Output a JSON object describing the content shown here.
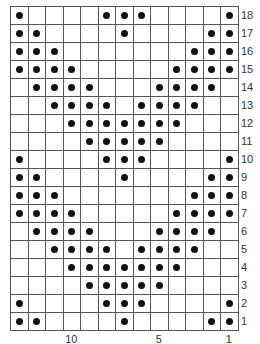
{
  "chart_data": {
    "type": "knitting-chart",
    "columns": 13,
    "rows": 18,
    "column_numbering": "right-to-left",
    "row_numbering": "bottom-to-top",
    "column_labels": [
      {
        "label": "10",
        "column": 10
      },
      {
        "label": "5",
        "column": 5
      },
      {
        "label": "1",
        "column": 1
      }
    ],
    "symbol": "dot",
    "grid_rows_top_to_bottom": [
      {
        "row": 18,
        "cells": "1000011100001"
      },
      {
        "row": 17,
        "cells": "1100001000011"
      },
      {
        "row": 16,
        "cells": "1110000000111"
      },
      {
        "row": 15,
        "cells": "1111000001111"
      },
      {
        "row": 14,
        "cells": "0111100011110"
      },
      {
        "row": 13,
        "cells": "0011110111100"
      },
      {
        "row": 12,
        "cells": "0001111111000"
      },
      {
        "row": 11,
        "cells": "0000111110000"
      },
      {
        "row": 10,
        "cells": "1000011100001"
      },
      {
        "row": 9,
        "cells": "1100001000011"
      },
      {
        "row": 8,
        "cells": "1110000000111"
      },
      {
        "row": 7,
        "cells": "1111000001111"
      },
      {
        "row": 6,
        "cells": "0111100011110"
      },
      {
        "row": 5,
        "cells": "0011110111100"
      },
      {
        "row": 4,
        "cells": "0001111111000"
      },
      {
        "row": 3,
        "cells": "0000111110000"
      },
      {
        "row": 2,
        "cells": "1000011100001"
      },
      {
        "row": 1,
        "cells": "1100001000011"
      }
    ]
  },
  "colors": {
    "grid": "#555555",
    "dot": "#111111",
    "label": "#333333"
  }
}
